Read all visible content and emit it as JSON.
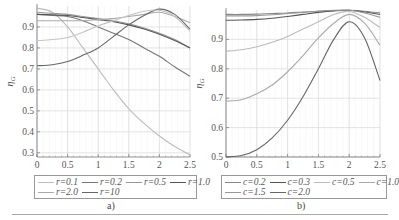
{
  "chart_data": [
    {
      "type": "line",
      "caption": "a)",
      "xlabel": "η",
      "ylabel": "η_G",
      "xlim": [
        0,
        2.5
      ],
      "ylim": [
        0.28,
        1.0
      ],
      "xticks": [
        "0",
        "0.5",
        "1",
        "1.5",
        "2",
        "2.5"
      ],
      "yticks": [
        "0.3",
        "0.4",
        "0.5",
        "0.6",
        "0.7",
        "0.8",
        "0.9"
      ],
      "grid": true,
      "legend_position": "bottom",
      "x": [
        0,
        0.25,
        0.5,
        0.75,
        1.0,
        1.25,
        1.5,
        1.75,
        2.0,
        2.25,
        2.5
      ],
      "series": [
        {
          "name": "r=0.1",
          "color": "#bbbbbb",
          "values": [
            0.99,
            0.97,
            0.9,
            0.8,
            0.7,
            0.6,
            0.51,
            0.44,
            0.38,
            0.33,
            0.29
          ]
        },
        {
          "name": "r=0.2",
          "color": "#777777",
          "values": [
            0.96,
            0.955,
            0.95,
            0.93,
            0.9,
            0.87,
            0.84,
            0.8,
            0.76,
            0.71,
            0.665
          ]
        },
        {
          "name": "r=0.5",
          "color": "#999999",
          "values": [
            0.97,
            0.965,
            0.96,
            0.95,
            0.94,
            0.93,
            0.915,
            0.895,
            0.87,
            0.84,
            0.8
          ]
        },
        {
          "name": "r=1.0",
          "color": "#555555",
          "values": [
            0.96,
            0.958,
            0.955,
            0.945,
            0.935,
            0.925,
            0.91,
            0.89,
            0.865,
            0.835,
            0.8
          ]
        },
        {
          "name": "r=2.0",
          "color": "#aaaaaa",
          "values": [
            0.93,
            0.93,
            0.93,
            0.93,
            0.935,
            0.94,
            0.95,
            0.96,
            0.97,
            0.95,
            0.92
          ]
        },
        {
          "name": "r=10",
          "color": "#666666",
          "values": [
            0.715,
            0.72,
            0.735,
            0.765,
            0.8,
            0.855,
            0.91,
            0.955,
            0.985,
            0.96,
            0.89
          ]
        },
        {
          "name": "r=5 (unlabeled)",
          "color": "#c4c4c4",
          "values": [
            0.835,
            0.84,
            0.85,
            0.875,
            0.905,
            0.93,
            0.955,
            0.975,
            0.98,
            0.95,
            0.88
          ]
        }
      ]
    },
    {
      "type": "line",
      "caption": "b)",
      "xlabel": "η",
      "ylabel": "η_G",
      "xlim": [
        0,
        2.5
      ],
      "ylim": [
        0.5,
        1.0
      ],
      "xticks": [
        "0",
        "0.5",
        "1",
        "1.5",
        "2",
        "2.5"
      ],
      "yticks": [
        "0.5",
        "0.6",
        "0.7",
        "0.8",
        "0.9"
      ],
      "grid": true,
      "legend_position": "bottom",
      "x": [
        0,
        0.25,
        0.5,
        0.75,
        1.0,
        1.25,
        1.5,
        1.75,
        2.0,
        2.25,
        2.5
      ],
      "series": [
        {
          "name": "c=0.2",
          "color": "#888888",
          "values": [
            0.985,
            0.985,
            0.986,
            0.988,
            0.99,
            0.993,
            0.996,
            0.998,
            0.999,
            0.996,
            0.99
          ]
        },
        {
          "name": "c=0.3",
          "color": "#555555",
          "values": [
            0.965,
            0.966,
            0.968,
            0.972,
            0.978,
            0.985,
            0.992,
            0.997,
            0.999,
            0.993,
            0.985
          ]
        },
        {
          "name": "c=0.5",
          "color": "#bbbbbb",
          "values": [
            0.86,
            0.865,
            0.875,
            0.89,
            0.91,
            0.935,
            0.96,
            0.985,
            0.995,
            0.975,
            0.94
          ]
        },
        {
          "name": "c=1.0",
          "color": "#aaaaaa",
          "values": [
            0.69,
            0.695,
            0.715,
            0.745,
            0.79,
            0.845,
            0.905,
            0.955,
            0.985,
            0.955,
            0.88
          ]
        },
        {
          "name": "c=1.5",
          "color": "#999999",
          "values": [
            0.98,
            0.98,
            0.981,
            0.984,
            0.988,
            0.992,
            0.996,
            0.999,
            0.999,
            0.99,
            0.975
          ]
        },
        {
          "name": "c=2.0",
          "color": "#666666",
          "values": [
            0.5,
            0.505,
            0.525,
            0.565,
            0.625,
            0.705,
            0.8,
            0.9,
            0.96,
            0.905,
            0.76
          ]
        }
      ]
    }
  ],
  "panels": {
    "a": {
      "caption": "a)",
      "xlabel": "η",
      "ylabel_main": "η",
      "ylabel_sub": "G",
      "legend": [
        [
          "r=0.1",
          "r=0.2",
          "r=0.5",
          "r=1.0"
        ],
        [
          "r=2.0",
          "r=10"
        ]
      ]
    },
    "b": {
      "caption": "b)",
      "xlabel": "η",
      "ylabel_main": "η",
      "ylabel_sub": "G",
      "legend": [
        [
          "c=0.2",
          "c=0.3",
          "c=0.5",
          "c=1.0"
        ],
        [
          "c=1.5",
          "c=2.0"
        ]
      ]
    }
  }
}
